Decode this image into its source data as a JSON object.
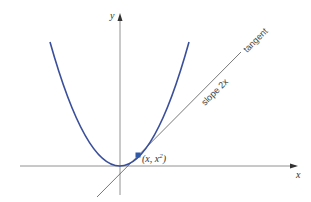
{
  "figure": {
    "type": "diagram",
    "axes": {
      "x_label": "x",
      "y_label": "y"
    },
    "curve": {
      "equation": "y = x^2",
      "color": "#3a4f9c"
    },
    "point": {
      "label_main": "(x, x",
      "label_sup": "2",
      "label_end": ")",
      "color": "#2f5aa8"
    },
    "tangent": {
      "label": "tangent",
      "slope_label": "slope 2x",
      "color": "#555555"
    }
  }
}
